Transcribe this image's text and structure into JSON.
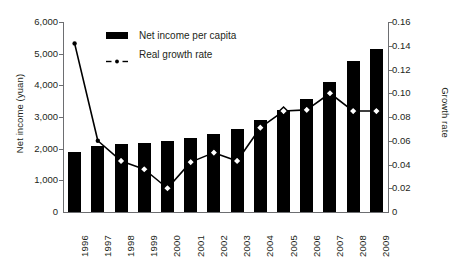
{
  "chart_data": {
    "type": "bar",
    "title": "",
    "subtitle": "",
    "xlabel": "",
    "ylabel": "Net income (yuan)",
    "y2label": "Growth rate",
    "categories": [
      "1996",
      "1997",
      "1998",
      "1999",
      "2000",
      "2001",
      "2002",
      "2003",
      "2004",
      "2005",
      "2006",
      "2007",
      "2008",
      "2009"
    ],
    "ylim": [
      0,
      6000
    ],
    "y2lim": [
      0,
      0.16
    ],
    "yticks": [
      "0",
      "1,000",
      "2,000",
      "3,000",
      "4,000",
      "5,000",
      "6,000"
    ],
    "ytick_values": [
      0,
      1000,
      2000,
      3000,
      4000,
      5000,
      6000
    ],
    "y2ticks": [
      "0",
      "0.02",
      "0.04",
      "0.06",
      "0.08",
      "0.10",
      "0.12",
      "0.14",
      "0.16"
    ],
    "y2tick_values": [
      0,
      0.02,
      0.04,
      0.06,
      0.08,
      0.1,
      0.12,
      0.14,
      0.16
    ],
    "grid": false,
    "legend_position": "top-left",
    "series": [
      {
        "name": "Net income per capita",
        "type": "bar",
        "axis": "left",
        "color": "#000000",
        "values": [
          1900,
          2080,
          2140,
          2190,
          2230,
          2350,
          2460,
          2610,
          2900,
          3230,
          3580,
          4120,
          4770,
          5150
        ]
      },
      {
        "name": "Real growth rate",
        "type": "line",
        "axis": "right",
        "color": "#000000",
        "marker": "diamond-open",
        "values": [
          0.142,
          0.06,
          0.043,
          0.036,
          0.02,
          0.042,
          0.05,
          0.043,
          0.071,
          0.085,
          0.086,
          0.1,
          0.085,
          0.085
        ],
        "marker_styles": [
          "dot-filled",
          "dot-filled",
          "diamond-open",
          "diamond-open",
          "diamond-open",
          "diamond-open",
          "diamond-open",
          "diamond-open",
          "diamond-open",
          "diamond-open",
          "diamond-open",
          "diamond-open",
          "diamond-open",
          "diamond-open"
        ]
      }
    ]
  },
  "legend": {
    "items": [
      {
        "label": "Net income per capita",
        "marker": "bar-swatch"
      },
      {
        "label": "Real growth rate",
        "marker": "line-dot-swatch"
      }
    ]
  },
  "colors": {
    "series": "#000000",
    "axis": "#6d6e71",
    "text": "#231f20",
    "background": "#ffffff"
  }
}
